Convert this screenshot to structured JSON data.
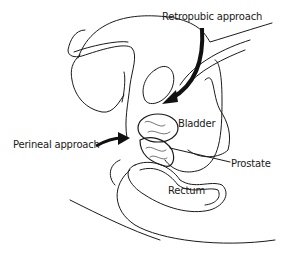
{
  "diagram": {
    "type": "anatomical cross-section",
    "labels": {
      "retropubic": "Retropubic approach",
      "perineal": "Perineal approach",
      "bladder": "Bladder",
      "prostate": "Prostate",
      "rectum": "Rectum"
    },
    "colors": {
      "line": "#1a1a1a",
      "background": "#ffffff"
    }
  }
}
